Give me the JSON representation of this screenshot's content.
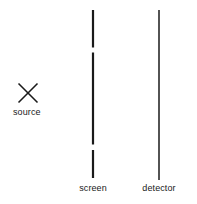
{
  "figure": {
    "type": "double-slit-experiment-diagram",
    "background_color": "#ffffff",
    "stroke_color": "#1a1a1a",
    "width": 197,
    "height": 204
  },
  "source": {
    "label": "source",
    "marker": "x-marker",
    "center_x": 28,
    "center_y": 93,
    "size": 19,
    "stroke_width": 1.6
  },
  "screen": {
    "label": "screen",
    "x": 93,
    "top": 10,
    "bottom": 178,
    "stroke_width": 2.2,
    "slits": [
      {
        "name": "upper-slit",
        "top": 47.5,
        "bottom": 52.5
      },
      {
        "name": "lower-slit",
        "top": 144.5,
        "bottom": 150.0
      }
    ],
    "segments": [
      {
        "name": "screen-segment-top",
        "top": 10,
        "bottom": 47.5
      },
      {
        "name": "screen-segment-middle",
        "top": 52.5,
        "bottom": 144.5
      },
      {
        "name": "screen-segment-bottom",
        "top": 150.0,
        "bottom": 178
      }
    ]
  },
  "detector": {
    "label": "detector",
    "x": 159,
    "top": 10,
    "bottom": 180,
    "stroke_width": 1.5
  }
}
